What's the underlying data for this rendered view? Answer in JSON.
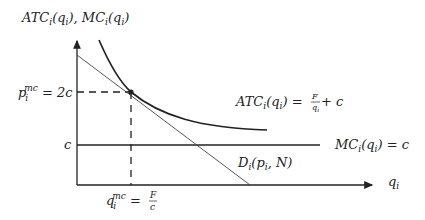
{
  "diagram": {
    "y_axis_label": {
      "main": "ATC",
      "sub1": "i",
      "mid": "(q",
      "sub2": "i",
      "end": "), MC",
      "sub3": "i",
      "mid2": "(q",
      "sub4": "i",
      "close": ")"
    },
    "x_axis_label": {
      "main": "q",
      "sub": "i"
    },
    "price_label": {
      "main": "p",
      "sub": "i",
      "sup": "mc",
      "rhs": " = 2c"
    },
    "c_label": "c",
    "quantity_label": {
      "main": "q",
      "sub": "i",
      "sup": "mc",
      "eq": " = ",
      "num": "F",
      "den": "c"
    },
    "atc_label": {
      "lhs": "ATC",
      "sub": "i",
      "arg": "(q",
      "argsub": "i",
      "close": ") = ",
      "num": "F",
      "den": "q",
      "densub": "i",
      "plus": " + c"
    },
    "mc_label": {
      "lhs": "MC",
      "sub": "i",
      "arg": "(q",
      "argsub": "i",
      "close": ") = c"
    },
    "demand_label": {
      "lhs": "D",
      "sub": "i",
      "arg": "(p",
      "argsub": "i",
      "rest": ", N)"
    },
    "curves": [
      "ATC",
      "MC",
      "Demand"
    ],
    "colors": {
      "ink": "#222222",
      "demand": "#444444"
    }
  }
}
